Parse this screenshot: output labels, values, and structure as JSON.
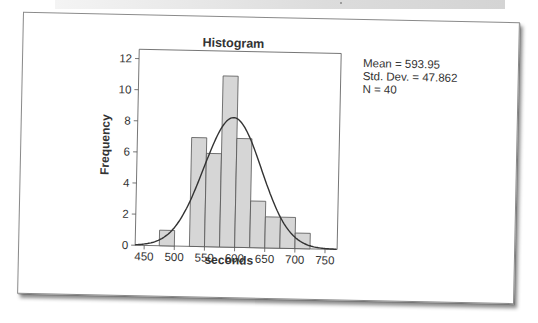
{
  "chart_data": {
    "type": "bar",
    "title": "Histogram",
    "xlabel": "seconds",
    "ylabel": "Frequency",
    "bin_width": 25,
    "bins": [
      {
        "start": 475,
        "end": 500,
        "count": 1
      },
      {
        "start": 500,
        "end": 525,
        "count": 0
      },
      {
        "start": 525,
        "end": 550,
        "count": 7
      },
      {
        "start": 550,
        "end": 575,
        "count": 6
      },
      {
        "start": 575,
        "end": 600,
        "count": 11
      },
      {
        "start": 600,
        "end": 625,
        "count": 7
      },
      {
        "start": 625,
        "end": 650,
        "count": 3
      },
      {
        "start": 650,
        "end": 675,
        "count": 2
      },
      {
        "start": 675,
        "end": 700,
        "count": 2
      },
      {
        "start": 700,
        "end": 725,
        "count": 1
      }
    ],
    "categories": [
      "475-500",
      "500-525",
      "525-550",
      "550-575",
      "575-600",
      "600-625",
      "625-650",
      "650-675",
      "675-700",
      "700-725"
    ],
    "values": [
      1,
      0,
      7,
      6,
      11,
      7,
      3,
      2,
      2,
      1
    ],
    "x_ticks": [
      450,
      500,
      550,
      600,
      650,
      700,
      750
    ],
    "y_ticks": [
      0,
      2,
      4,
      6,
      8,
      10,
      12
    ],
    "xlim": [
      435,
      770
    ],
    "ylim": [
      0,
      12.6
    ],
    "grid": false,
    "overlay": {
      "type": "normal_curve",
      "mean": 593.95,
      "std_dev": 47.862,
      "n": 40
    },
    "legend": [
      "Mean = 593.95",
      "Std. Dev. = 47.862",
      "N = 40"
    ]
  },
  "stats": {
    "mean_label": "Mean = 593.95",
    "std_label": "Std. Dev. = 47.862",
    "n_label": "N = 40"
  },
  "colors": {
    "bar_fill": "#d6d6d6",
    "bar_stroke": "#555555",
    "curve": "#333333",
    "axis": "#555555"
  }
}
